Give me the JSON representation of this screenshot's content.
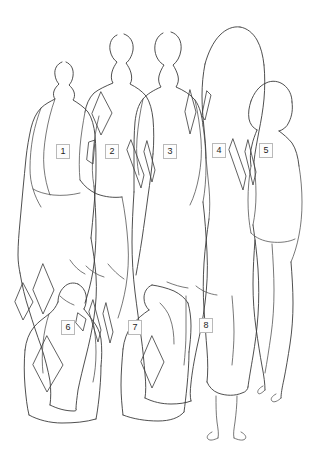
{
  "diagram": {
    "type": "line-drawing",
    "background_color": "#ffffff",
    "line_color": "#3b3b3b",
    "label_border_color": "#b9b9b9",
    "label_text_color": "#1d1d1d",
    "width": 316,
    "height": 449,
    "figure_count": 8,
    "labels": [
      {
        "id": "1",
        "text": "1",
        "x": 56,
        "y": 144
      },
      {
        "id": "2",
        "text": "2",
        "x": 105,
        "y": 144
      },
      {
        "id": "3",
        "text": "3",
        "x": 163,
        "y": 144
      },
      {
        "id": "4",
        "text": "4",
        "x": 212,
        "y": 143
      },
      {
        "id": "5",
        "text": "5",
        "x": 259,
        "y": 143
      },
      {
        "id": "6",
        "text": "6",
        "x": 61,
        "y": 320
      },
      {
        "id": "7",
        "text": "7",
        "x": 128,
        "y": 320
      },
      {
        "id": "8",
        "text": "8",
        "x": 199,
        "y": 318
      }
    ]
  }
}
